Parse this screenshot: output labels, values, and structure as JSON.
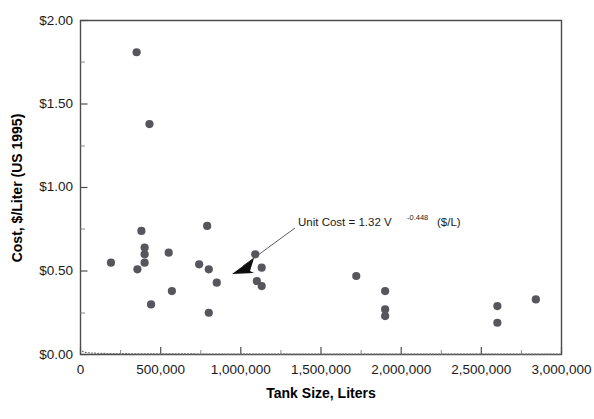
{
  "chart_data": {
    "type": "scatter",
    "title": "",
    "xlabel": "Tank Size, Liters",
    "ylabel": "Cost, $/Liter (US 1995)",
    "xlim": [
      0,
      3000000
    ],
    "ylim": [
      0,
      2.0
    ],
    "grid": false,
    "legend": "none",
    "x_ticks": [
      0,
      500000,
      1000000,
      1500000,
      2000000,
      2500000,
      3000000
    ],
    "x_tick_labels": [
      "0",
      "500,000",
      "1,000,000",
      "1,500,000",
      "2,000,000",
      "2,500,000",
      "3,000,000"
    ],
    "x_minor_tick_interval": 250000,
    "y_ticks": [
      0,
      0.5,
      1.0,
      1.5,
      2.0
    ],
    "y_tick_labels": [
      "$0.00",
      "$0.50",
      "$1.00",
      "$1.50",
      "$2.00"
    ],
    "y_minor_tick_interval": 0.25,
    "point_color": "#56565c",
    "curve_color": "#6e6e6e",
    "series": [
      {
        "name": "Tank unit cost observations",
        "marker": "filled-circle",
        "points": [
          {
            "x": 350000,
            "y": 1.81
          },
          {
            "x": 430000,
            "y": 1.38
          },
          {
            "x": 190000,
            "y": 0.55
          },
          {
            "x": 380000,
            "y": 0.74
          },
          {
            "x": 400000,
            "y": 0.64
          },
          {
            "x": 400000,
            "y": 0.6
          },
          {
            "x": 400000,
            "y": 0.55
          },
          {
            "x": 355000,
            "y": 0.51
          },
          {
            "x": 440000,
            "y": 0.3
          },
          {
            "x": 550000,
            "y": 0.61
          },
          {
            "x": 570000,
            "y": 0.38
          },
          {
            "x": 790000,
            "y": 0.77
          },
          {
            "x": 740000,
            "y": 0.54
          },
          {
            "x": 800000,
            "y": 0.51
          },
          {
            "x": 800000,
            "y": 0.25
          },
          {
            "x": 850000,
            "y": 0.43
          },
          {
            "x": 1090000,
            "y": 0.6
          },
          {
            "x": 1130000,
            "y": 0.52
          },
          {
            "x": 1100000,
            "y": 0.44
          },
          {
            "x": 1130000,
            "y": 0.41
          },
          {
            "x": 1720000,
            "y": 0.47
          },
          {
            "x": 1900000,
            "y": 0.38
          },
          {
            "x": 1900000,
            "y": 0.27
          },
          {
            "x": 1900000,
            "y": 0.23
          },
          {
            "x": 2600000,
            "y": 0.29
          },
          {
            "x": 2600000,
            "y": 0.19
          },
          {
            "x": 2840000,
            "y": 0.33
          }
        ]
      }
    ],
    "fit_curve": {
      "label": "Unit Cost = 1.32 V -0.448 ($/L)",
      "label_parts": {
        "prefix": "Unit Cost = 1.32 V",
        "exponent": "-0.448",
        "suffix": "($/L)"
      },
      "coefficient": 1.32,
      "exponent": -0.448,
      "equation": "y = 1.32 * x^-0.448",
      "style": "dotted"
    },
    "annotation": {
      "text": "Unit Cost = 1.32 V -0.448 ($/L)",
      "points_to_x": 870000,
      "points_to_y": 0.47
    }
  }
}
